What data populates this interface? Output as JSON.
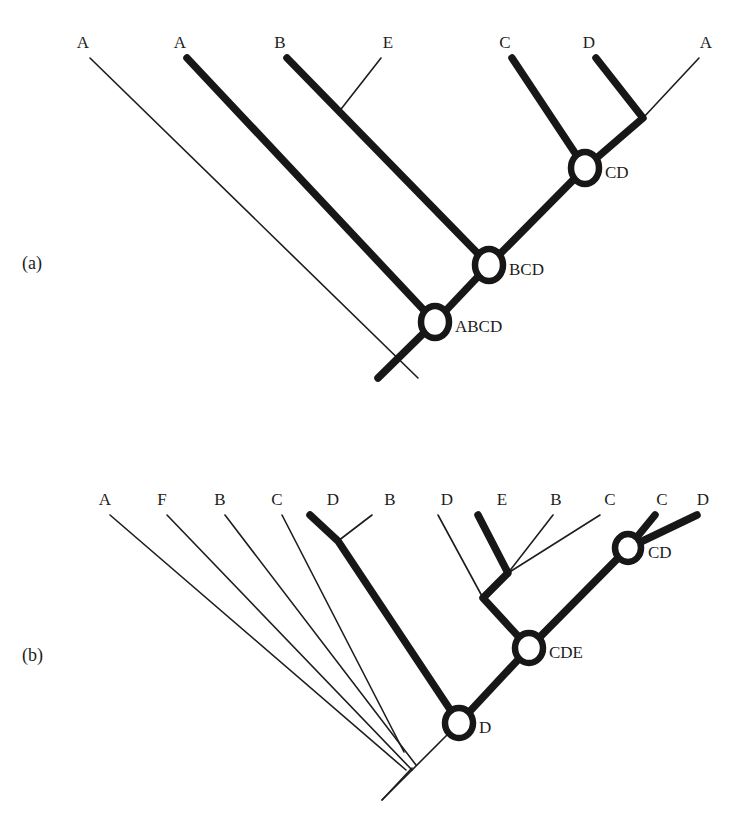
{
  "figure": {
    "background_color": "#ffffff",
    "ink_color": "#171717",
    "top_cropped_artifact": "",
    "panels": [
      {
        "id": "panel-a",
        "panel_label": "(a)",
        "panel_label_pos": {
          "x": 22,
          "y": 269
        },
        "leaf_label_y": 48,
        "leaves": [
          {
            "label": "A",
            "x": 83,
            "tip_x": 90,
            "tip_y": 58,
            "weight": "thin"
          },
          {
            "label": "A",
            "x": 180,
            "tip_x": 187,
            "tip_y": 58,
            "weight": "thick"
          },
          {
            "label": "B",
            "x": 280,
            "tip_x": 287,
            "tip_y": 58,
            "weight": "thick"
          },
          {
            "label": "E",
            "x": 388,
            "tip_x": 381,
            "tip_y": 58,
            "weight": "thin"
          },
          {
            "label": "C",
            "x": 505,
            "tip_x": 512,
            "tip_y": 58,
            "weight": "thick"
          },
          {
            "label": "D",
            "x": 589,
            "tip_x": 596,
            "tip_y": 58,
            "weight": "thick"
          },
          {
            "label": "A",
            "x": 706,
            "tip_x": 699,
            "tip_y": 58,
            "weight": "thin"
          }
        ],
        "nodes": [
          {
            "label": "CD",
            "x": 585,
            "y": 168,
            "rx": 14,
            "ry": 16,
            "label_dx": 20,
            "label_dy": 10
          },
          {
            "label": "BCD",
            "x": 489,
            "y": 265,
            "rx": 14,
            "ry": 16,
            "label_dx": 20,
            "label_dy": 10
          },
          {
            "label": "ABCD",
            "x": 435,
            "y": 322,
            "rx": 14,
            "ry": 16,
            "label_dx": 20,
            "label_dy": 10
          }
        ],
        "junctions": [
          {
            "name": "b-e-join",
            "x": 338,
            "y": 113
          },
          {
            "name": "d-a-join",
            "x": 643,
            "y": 118
          }
        ],
        "root": {
          "x": 378,
          "y": 378
        },
        "branches_thick": [
          "M 187 58 L 435 322",
          "M 287 58 L 489 265",
          "M 512 58 L 585 168",
          "M 596 58 L 643 118 L 585 168",
          "M 585 168 L 489 265",
          "M 489 265 L 435 322",
          "M 435 322 L 378 378"
        ],
        "branches_thin": [
          "M 90 58 L 418 378",
          "M 381 58 L 338 113",
          "M 699 58 L 643 118"
        ]
      },
      {
        "id": "panel-b",
        "panel_label": "(b)",
        "panel_label_pos": {
          "x": 22,
          "y": 661
        },
        "leaf_label_y": 505,
        "leaves": [
          {
            "label": "A",
            "x": 105,
            "tip_x": 110,
            "tip_y": 515,
            "weight": "thin"
          },
          {
            "label": "F",
            "x": 162,
            "tip_x": 167,
            "tip_y": 515,
            "weight": "thin"
          },
          {
            "label": "B",
            "x": 220,
            "tip_x": 225,
            "tip_y": 515,
            "weight": "thin"
          },
          {
            "label": "C",
            "x": 277,
            "tip_x": 282,
            "tip_y": 515,
            "weight": "thin"
          },
          {
            "label": "D",
            "x": 333,
            "tip_x": 310,
            "tip_y": 515,
            "weight": "thick"
          },
          {
            "label": "B",
            "x": 390,
            "tip_x": 372,
            "tip_y": 515,
            "weight": "thin"
          },
          {
            "label": "D",
            "x": 447,
            "tip_x": 438,
            "tip_y": 515,
            "weight": "thin"
          },
          {
            "label": "E",
            "x": 502,
            "tip_x": 478,
            "tip_y": 515,
            "weight": "thick"
          },
          {
            "label": "B",
            "x": 556,
            "tip_x": 553,
            "tip_y": 515,
            "weight": "thin"
          },
          {
            "label": "C",
            "x": 610,
            "tip_x": 600,
            "tip_y": 515,
            "weight": "thin"
          },
          {
            "label": "C",
            "x": 662,
            "tip_x": 655,
            "tip_y": 515,
            "weight": "thick"
          },
          {
            "label": "D",
            "x": 703,
            "tip_x": 697,
            "tip_y": 515,
            "weight": "thick"
          }
        ],
        "nodes": [
          {
            "label": "CD",
            "x": 628,
            "y": 548,
            "rx": 13,
            "ry": 14,
            "label_dx": 20,
            "label_dy": 10
          },
          {
            "label": "CDE",
            "x": 529,
            "y": 648,
            "rx": 14,
            "ry": 15,
            "label_dx": 20,
            "label_dy": 10
          },
          {
            "label": "D",
            "x": 459,
            "y": 723,
            "rx": 14,
            "ry": 15,
            "label_dx": 20,
            "label_dy": 10
          }
        ],
        "junctions": [
          {
            "name": "d-b-join",
            "x": 338,
            "y": 541
          },
          {
            "name": "e-b-c-join",
            "x": 508,
            "y": 573
          },
          {
            "name": "cde-bend",
            "x": 483,
            "y": 598
          }
        ],
        "root": {
          "x": 382,
          "y": 800
        },
        "thin_convergence": {
          "x": 410,
          "y": 770
        },
        "branches_thick": [
          "M 310 515 L 338 541 L 459 723",
          "M 478 515 L 508 573 L 483 598 L 529 648",
          "M 655 515 L 628 548",
          "M 697 515 L 628 548",
          "M 628 548 L 529 648",
          "M 529 648 L 459 723"
        ],
        "branches_thin": [
          "M 110 515 L 406 770",
          "M 167 515 L 412 770",
          "M 225 515 L 416 765",
          "M 282 515 L 404 752",
          "M 372 515 L 338 541",
          "M 438 515 L 483 598",
          "M 553 515 L 508 573",
          "M 600 515 L 508 573",
          "M 459 723 L 382 800",
          "M 382 800 L 410 770"
        ]
      }
    ]
  }
}
